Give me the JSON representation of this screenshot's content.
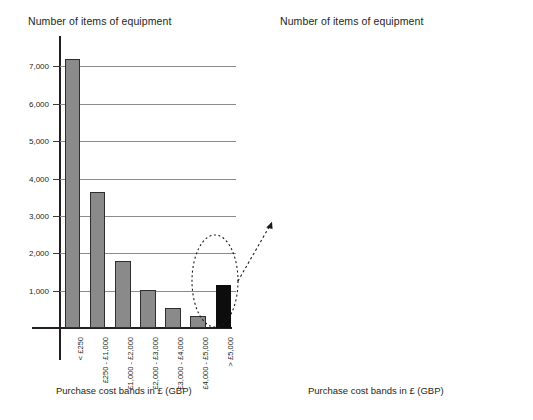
{
  "figure": {
    "background": "#ffffff",
    "text_color": "#231f20"
  },
  "left_panel": {
    "title": "Number of items of equipment",
    "axis_caption": "Purchase cost bands in £ (GBP)",
    "highlight": {
      "name": "dashed-ellipse-callout",
      "target_category": "> £5,000",
      "arrow": "dashed-arrow-to-right-chart"
    }
  },
  "right_panel": {
    "title": "Number of items of equipment",
    "axis_caption": "Purchase cost bands in £ (GBP)"
  },
  "chart_data": [
    {
      "id": "left-chart",
      "type": "bar",
      "title": "Number of items of equipment",
      "xlabel": "Purchase cost bands in £ (GBP)",
      "ylabel": "Number of items of equipment",
      "categories": [
        "< £250",
        "£250 - £1,000",
        "£1,000 - £2,000",
        "£2,000 - £3,000",
        "£3,000 - £4,000",
        "£4,000 - £5,000",
        "> £5,000"
      ],
      "values": [
        7200,
        3650,
        1780,
        1030,
        540,
        310,
        1150
      ],
      "bar_colors": [
        "#8a8a8a",
        "#8a8a8a",
        "#8a8a8a",
        "#8a8a8a",
        "#8a8a8a",
        "#8a8a8a",
        "#0d0d0d"
      ],
      "yticks": [
        1000,
        2000,
        3000,
        4000,
        5000,
        6000,
        7000
      ],
      "ytick_labels": [
        "1,000",
        "2,000",
        "3,000",
        "4,000",
        "5,000",
        "6,000",
        "7,000"
      ],
      "ylim": [
        0,
        7600
      ],
      "grid": true,
      "legend": "none"
    },
    {
      "id": "right-chart",
      "type": "bar",
      "title": "Number of items of equipment",
      "xlabel": "Purchase cost bands in £ (GBP)",
      "ylabel": "Number of items of equipment",
      "categories": [
        "£5,000 - £10,000",
        "£10,000 - £25,000",
        "£25,000 - £50,000",
        "£50,000 - £100,000",
        "£100,000 - £250,000",
        "> £250,000"
      ],
      "values": [
        683,
        250,
        128,
        52,
        18,
        22
      ],
      "bar_colors": [
        "#0d0d0d",
        "#0d0d0d",
        "#0d0d0d",
        "#0d0d0d",
        "#0d0d0d",
        "#0d0d0d"
      ],
      "yticks": [
        100,
        200,
        300,
        400,
        500,
        600,
        700
      ],
      "ytick_labels": [
        "100",
        "200",
        "300",
        "400",
        "500",
        "600",
        "700"
      ],
      "ylim": [
        0,
        745
      ],
      "grid": true,
      "legend": "none"
    }
  ]
}
